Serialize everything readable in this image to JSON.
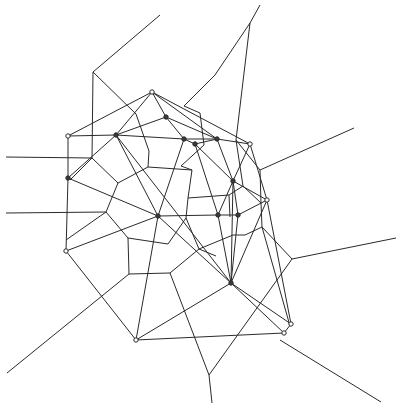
{
  "diagram": {
    "type": "voronoi-delaunay",
    "width": 404,
    "height": 411,
    "colors": {
      "line": "#2a2a2a",
      "background": "#ffffff"
    },
    "sites": [
      {
        "id": "A",
        "x": 152,
        "y": 92,
        "filled": false
      },
      {
        "id": "B",
        "x": 166,
        "y": 117,
        "filled": true
      },
      {
        "id": "C",
        "x": 68,
        "y": 136,
        "filled": false
      },
      {
        "id": "D",
        "x": 116,
        "y": 135,
        "filled": true
      },
      {
        "id": "E",
        "x": 184,
        "y": 139,
        "filled": true
      },
      {
        "id": "F",
        "x": 195,
        "y": 144,
        "filled": true
      },
      {
        "id": "G",
        "x": 217,
        "y": 139,
        "filled": true
      },
      {
        "id": "H",
        "x": 250,
        "y": 144,
        "filled": false
      },
      {
        "id": "I",
        "x": 68,
        "y": 178,
        "filled": true
      },
      {
        "id": "J",
        "x": 233,
        "y": 181,
        "filled": true
      },
      {
        "id": "K",
        "x": 267,
        "y": 200,
        "filled": false
      },
      {
        "id": "L",
        "x": 158,
        "y": 216,
        "filled": true
      },
      {
        "id": "M",
        "x": 218,
        "y": 215,
        "filled": true
      },
      {
        "id": "N",
        "x": 238,
        "y": 215,
        "filled": true
      },
      {
        "id": "O",
        "x": 66,
        "y": 251,
        "filled": false
      },
      {
        "id": "P",
        "x": 231,
        "y": 283,
        "filled": true
      },
      {
        "id": "Q",
        "x": 291,
        "y": 324,
        "filled": false
      },
      {
        "id": "R",
        "x": 284,
        "y": 333,
        "filled": false
      },
      {
        "id": "S",
        "x": 136,
        "y": 340,
        "filled": false
      }
    ],
    "delaunay_edges": [
      [
        "A",
        "C"
      ],
      [
        "A",
        "D"
      ],
      [
        "A",
        "B"
      ],
      [
        "A",
        "G"
      ],
      [
        "A",
        "H"
      ],
      [
        "B",
        "D"
      ],
      [
        "B",
        "G"
      ],
      [
        "B",
        "E"
      ],
      [
        "C",
        "D"
      ],
      [
        "C",
        "I"
      ],
      [
        "D",
        "E"
      ],
      [
        "D",
        "L"
      ],
      [
        "D",
        "I"
      ],
      [
        "D",
        "P"
      ],
      [
        "E",
        "F"
      ],
      [
        "E",
        "G"
      ],
      [
        "E",
        "L"
      ],
      [
        "F",
        "G"
      ],
      [
        "F",
        "J"
      ],
      [
        "F",
        "M"
      ],
      [
        "G",
        "H"
      ],
      [
        "G",
        "J"
      ],
      [
        "H",
        "J"
      ],
      [
        "H",
        "K"
      ],
      [
        "I",
        "L"
      ],
      [
        "I",
        "O"
      ],
      [
        "J",
        "K"
      ],
      [
        "J",
        "M"
      ],
      [
        "J",
        "N"
      ],
      [
        "J",
        "P"
      ],
      [
        "K",
        "N"
      ],
      [
        "K",
        "P"
      ],
      [
        "K",
        "Q"
      ],
      [
        "L",
        "M"
      ],
      [
        "L",
        "O"
      ],
      [
        "L",
        "P"
      ],
      [
        "L",
        "S"
      ],
      [
        "M",
        "N"
      ],
      [
        "M",
        "P"
      ],
      [
        "N",
        "P"
      ],
      [
        "O",
        "S"
      ],
      [
        "P",
        "S"
      ],
      [
        "P",
        "Q"
      ],
      [
        "P",
        "R"
      ],
      [
        "R",
        "S"
      ],
      [
        "Q",
        "R"
      ]
    ],
    "voronoi_edges": [
      [
        [
          160,
          15
        ],
        [
          93,
          72
        ]
      ],
      [
        [
          93,
          72
        ],
        [
          92,
          158
        ]
      ],
      [
        [
          93,
          72
        ],
        [
          136,
          114
        ]
      ],
      [
        [
          260,
          5
        ],
        [
          250,
          23
        ]
      ],
      [
        [
          250,
          23
        ],
        [
          215,
          75
        ]
      ],
      [
        [
          215,
          75
        ],
        [
          184,
          106
        ]
      ],
      [
        [
          250,
          23
        ],
        [
          236,
          140
        ]
      ],
      [
        [
          6,
          157
        ],
        [
          92,
          158
        ]
      ],
      [
        [
          92,
          158
        ],
        [
          70,
          180
        ]
      ],
      [
        [
          92,
          158
        ],
        [
          118,
          183
        ]
      ],
      [
        [
          136,
          114
        ],
        [
          149,
          151
        ]
      ],
      [
        [
          149,
          151
        ],
        [
          148,
          167
        ]
      ],
      [
        [
          148,
          167
        ],
        [
          118,
          183
        ]
      ],
      [
        [
          148,
          167
        ],
        [
          192,
          170
        ]
      ],
      [
        [
          184,
          106
        ],
        [
          200,
          113
        ]
      ],
      [
        [
          200,
          113
        ],
        [
          204,
          145
        ]
      ],
      [
        [
          204,
          145
        ],
        [
          181,
          166
        ]
      ],
      [
        [
          181,
          166
        ],
        [
          192,
          170
        ]
      ],
      [
        [
          118,
          183
        ],
        [
          106,
          212
        ]
      ],
      [
        [
          106,
          212
        ],
        [
          128,
          238
        ]
      ],
      [
        [
          6,
          213
        ],
        [
          106,
          212
        ]
      ],
      [
        [
          128,
          238
        ],
        [
          168,
          244
        ]
      ],
      [
        [
          168,
          244
        ],
        [
          186,
          218
        ]
      ],
      [
        [
          186,
          218
        ],
        [
          188,
          198
        ]
      ],
      [
        [
          188,
          198
        ],
        [
          192,
          170
        ]
      ],
      [
        [
          188,
          198
        ],
        [
          229,
          195
        ]
      ],
      [
        [
          229,
          195
        ],
        [
          230,
          217
        ]
      ],
      [
        [
          229,
          195
        ],
        [
          243,
          186
        ]
      ],
      [
        [
          236,
          140
        ],
        [
          243,
          186
        ]
      ],
      [
        [
          243,
          186
        ],
        [
          261,
          203
        ]
      ],
      [
        [
          261,
          203
        ],
        [
          262,
          227
        ]
      ],
      [
        [
          262,
          227
        ],
        [
          245,
          235
        ]
      ],
      [
        [
          245,
          235
        ],
        [
          233,
          235
        ]
      ],
      [
        [
          233,
          235
        ],
        [
          199,
          249
        ]
      ],
      [
        [
          199,
          249
        ],
        [
          186,
          218
        ]
      ],
      [
        [
          261,
          203
        ],
        [
          260,
          170
        ]
      ],
      [
        [
          260,
          170
        ],
        [
          354,
          128
        ]
      ],
      [
        [
          260,
          170
        ],
        [
          236,
          140
        ]
      ],
      [
        [
          106,
          212
        ],
        [
          66,
          240
        ]
      ],
      [
        [
          128,
          238
        ],
        [
          129,
          274
        ]
      ],
      [
        [
          129,
          274
        ],
        [
          170,
          273
        ]
      ],
      [
        [
          129,
          274
        ],
        [
          7,
          373
        ]
      ],
      [
        [
          170,
          273
        ],
        [
          199,
          249
        ]
      ],
      [
        [
          170,
          273
        ],
        [
          209,
          375
        ]
      ],
      [
        [
          209,
          375
        ],
        [
          212,
          403
        ]
      ],
      [
        [
          209,
          375
        ],
        [
          292,
          259
        ]
      ],
      [
        [
          292,
          259
        ],
        [
          396,
          238
        ]
      ],
      [
        [
          292,
          259
        ],
        [
          262,
          227
        ]
      ],
      [
        [
          262,
          227
        ],
        [
          290,
          326
        ]
      ],
      [
        [
          280,
          340
        ],
        [
          381,
          402
        ]
      ],
      [
        [
          199,
          249
        ],
        [
          216,
          256
        ]
      ]
    ]
  }
}
